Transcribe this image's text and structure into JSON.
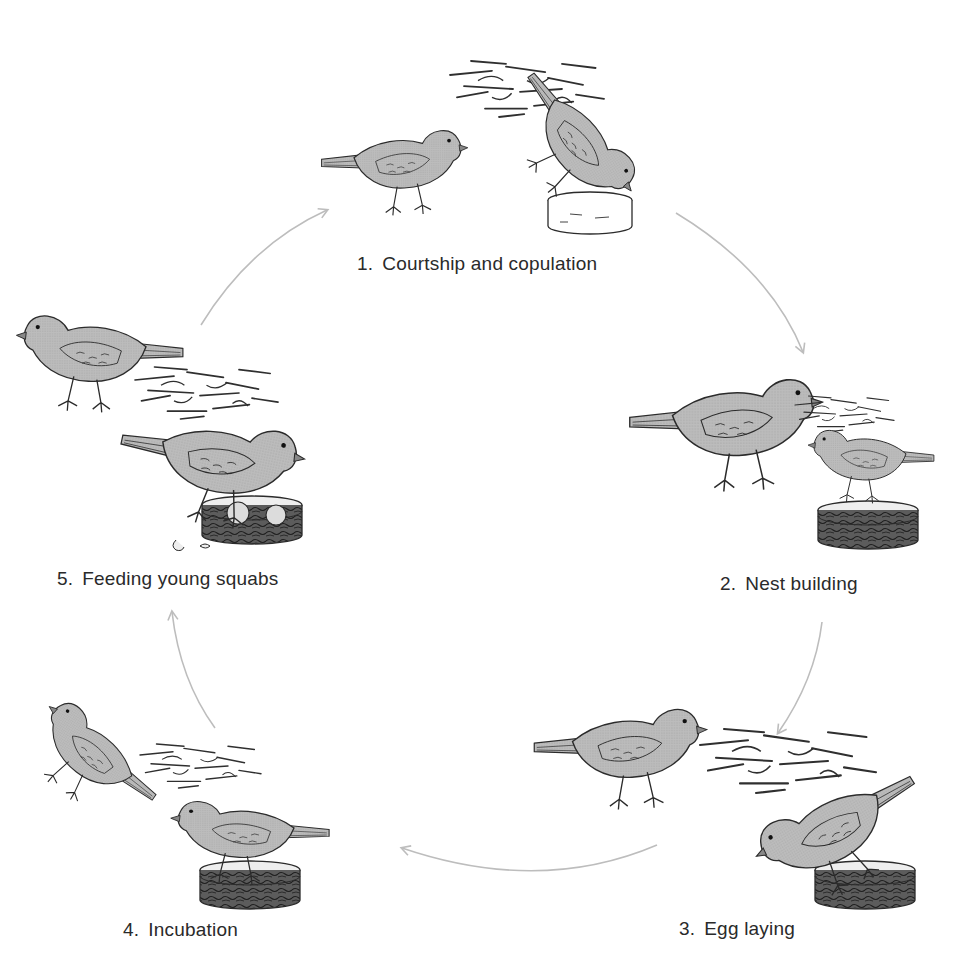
{
  "diagram": {
    "type": "cycle",
    "colors": {
      "bird_fill": "#b8b8b8",
      "bird_outline": "#2b2b2b",
      "nest_material": "#3a3a3a",
      "nest_bowl_fill": "#5a5a5a",
      "arrow": "#bdbdbd",
      "label_text": "#2a2a2a"
    },
    "stages": [
      {
        "number": "1.",
        "label": "Courtship and copulation",
        "description": "Two doves; one stands on empty bowl with nesting straw"
      },
      {
        "number": "2.",
        "label": "Nest building",
        "description": "One dove carries straw to the other sitting in a bowl with nest material"
      },
      {
        "number": "3.",
        "label": "Egg laying",
        "description": "Female sits on nest in bowl; male stands nearby"
      },
      {
        "number": "4.",
        "label": "Incubation",
        "description": "Dove sits on nest bowl; partner pecks at straw"
      },
      {
        "number": "5.",
        "label": "Feeding young squabs",
        "description": "Parent feeds squabs in bowl; broken eggshells beside"
      }
    ],
    "arrows": [
      {
        "from": "1",
        "to": "2"
      },
      {
        "from": "2",
        "to": "3"
      },
      {
        "from": "3",
        "to": "4"
      },
      {
        "from": "4",
        "to": "5"
      },
      {
        "from": "5",
        "to": "1"
      }
    ]
  }
}
